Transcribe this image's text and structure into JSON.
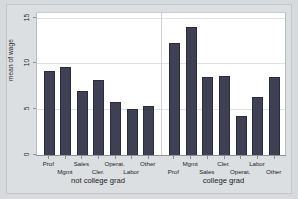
{
  "chart_data": {
    "type": "bar",
    "title": "",
    "subtitle": "",
    "xlabel": "",
    "ylabel": "mean of wage",
    "ylim": [
      0,
      15
    ],
    "yticks": [
      0,
      5,
      10,
      15
    ],
    "ytick_labels": [
      "0",
      "5",
      "10",
      "15"
    ],
    "grid": true,
    "legend": "none",
    "panel_variable": "college grad",
    "categories": [
      "Prof",
      "Mgmt",
      "Sales",
      "Cler.",
      "Operat.",
      "Labor",
      "Other"
    ],
    "panels": [
      {
        "title": "not college grad",
        "categories": [
          "Prof",
          "Mgmt",
          "Sales",
          "Cler.",
          "Operat.",
          "Labor",
          "Other"
        ],
        "values": [
          9.2,
          9.6,
          7.0,
          8.2,
          5.8,
          5.0,
          5.4
        ]
      },
      {
        "title": "college grad",
        "categories": [
          "Prof",
          "Mgmt",
          "Sales",
          "Cler.",
          "Operat.",
          "Labor",
          "Other"
        ],
        "values": [
          12.3,
          14.0,
          8.5,
          8.6,
          4.3,
          6.4,
          8.5
        ]
      }
    ],
    "colors": {
      "bar_fill": "#3f4054",
      "bar_border": "#2a2b3b",
      "plot_background": "#ffffff",
      "figure_background": "#d7dadd",
      "gridline": "#dfe2e5",
      "axis": "#8c9196"
    }
  }
}
